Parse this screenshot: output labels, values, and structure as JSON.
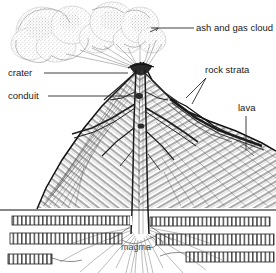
{
  "diagram": {
    "style": "pen-and-ink line drawing, stippled shading, white background",
    "colors": {
      "background": "#ffffff",
      "ink": "#111111",
      "stipple": "#7a7a7a",
      "label_text": "#1a1a1a",
      "leader_line": "#2a2a2a"
    },
    "labels": [
      {
        "id": "ash-and-gas-cloud",
        "text": "ash and gas cloud",
        "x": 196,
        "y": 28,
        "anchor": "start",
        "leader": "horizontal line running left from the text to an arrow touching the right lobe of the eruption plume"
      },
      {
        "id": "crater",
        "text": "crater",
        "x": 8,
        "y": 73,
        "anchor": "start",
        "leader": "horizontal line running right from the text to the summit crater"
      },
      {
        "id": "conduit",
        "text": "conduit",
        "x": 8,
        "y": 96,
        "anchor": "start",
        "leader": "horizontal line running right from the text to the central conduit pipe"
      },
      {
        "id": "rock-strata",
        "text": "rock strata",
        "x": 205,
        "y": 70,
        "anchor": "start",
        "leader": "two lines fanning down-left from the text to layered bands in the right flank"
      },
      {
        "id": "lava",
        "text": "lava",
        "x": 238,
        "y": 108,
        "anchor": "start",
        "leader": "vertical line running down from the text into the lava flow on the right flank"
      },
      {
        "id": "magma",
        "text": "magma",
        "x": 136,
        "y": 248,
        "anchor": "middle",
        "leader": "none, text sits directly over the magma root zone"
      }
    ],
    "features": [
      {
        "id": "eruption-plume",
        "name": "ash and gas cloud",
        "description": "large billowing stippled plume of three to four overlapping lobes drifting left from the summit"
      },
      {
        "id": "volcanic-cone",
        "name": "stratovolcano cone",
        "description": "steep cone with diagonally layered ash and lava beds, gentler right flank extending to the right edge"
      },
      {
        "id": "summit-crater",
        "name": "crater",
        "description": "dark notched depression at the apex of the cone"
      },
      {
        "id": "central-conduit",
        "name": "conduit",
        "description": "vertical pipe running from the magma root up through the cone to the crater"
      },
      {
        "id": "dikes",
        "name": "dikes",
        "description": "dark branching intrusions radiating from the conduit into the cone flanks"
      },
      {
        "id": "lava-flow",
        "name": "lava",
        "description": "dark flow band draping the right flank of the cone"
      },
      {
        "id": "rock-strata-bands",
        "name": "rock strata",
        "description": "three horizontal hatched sedimentary bands beneath the ground surface, offset and broken near the conduit"
      },
      {
        "id": "magma-root",
        "name": "magma",
        "description": "flared root of fine radiating lines spreading outward at the base of the conduit"
      }
    ]
  }
}
